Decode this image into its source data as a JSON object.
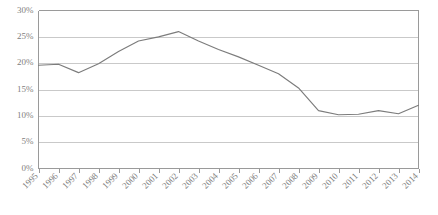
{
  "chart_data": {
    "type": "line",
    "title": "",
    "subtitle": "",
    "xlabel": "",
    "ylabel": "",
    "categories": [
      "1995",
      "1996",
      "1997",
      "1998",
      "1999",
      "2000",
      "2001",
      "2002",
      "2003",
      "2004",
      "2005",
      "2006",
      "2007",
      "2008",
      "2009",
      "2010",
      "2011",
      "2012",
      "2013",
      "2014"
    ],
    "values": [
      19.6,
      19.8,
      18.2,
      19.9,
      22.2,
      24.2,
      25.0,
      26.0,
      24.2,
      22.6,
      21.2,
      19.6,
      18.0,
      15.3,
      11.0,
      10.2,
      10.3,
      11.0,
      10.4,
      12.0
    ],
    "series": [
      {
        "name": "",
        "values": [
          19.6,
          19.8,
          18.2,
          19.9,
          22.2,
          24.2,
          25.0,
          26.0,
          24.2,
          22.6,
          21.2,
          19.6,
          18.0,
          15.3,
          11.0,
          10.2,
          10.3,
          11.0,
          10.4,
          12.0
        ]
      }
    ],
    "ylim": [
      0,
      30
    ],
    "yticks": [
      0,
      5,
      10,
      15,
      20,
      25,
      30
    ],
    "ytick_labels": [
      "0%",
      "5%",
      "10%",
      "15%",
      "20%",
      "25%",
      "30%"
    ],
    "xtick_labels": [
      "1995",
      "1996",
      "1997",
      "1998",
      "1999",
      "2000",
      "2001",
      "2002",
      "2003",
      "2004",
      "2005",
      "2006",
      "2007",
      "2008",
      "2009",
      "2010",
      "2011",
      "2012",
      "2013",
      "2014"
    ],
    "grid": true,
    "grid_axis": "y",
    "legend": false,
    "legend_position": "none",
    "line_color": "#7c7c7c",
    "grid_color": "#c9c9c9",
    "axis_color": "#9a9a9a",
    "label_color": "#808080",
    "background": "#ffffff",
    "xlabel_rotation": -45,
    "annotations": []
  }
}
